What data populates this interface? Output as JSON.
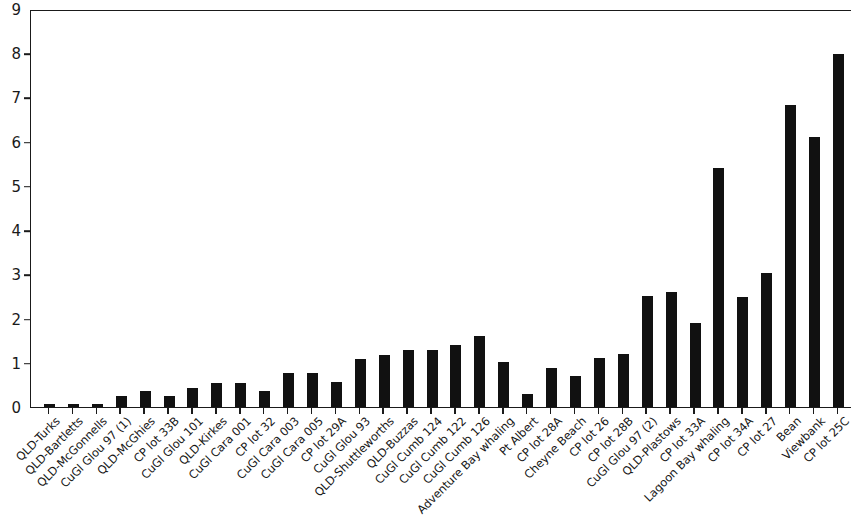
{
  "chart_data": {
    "type": "bar",
    "title": "",
    "subtitle": "",
    "xlabel": "",
    "ylabel": "",
    "ylim": [
      0,
      9
    ],
    "y_ticks": [
      0,
      1,
      2,
      3,
      4,
      5,
      6,
      7,
      8,
      9
    ],
    "grid": false,
    "legend": null,
    "bar_color": "#111111",
    "axis_color": "#1a1a1a",
    "categories": [
      "QLD-Turks",
      "QLD-Bartletts",
      "QLD-McGonnells",
      "CuGl Glou 97 (1)",
      "QLD-McGhies",
      "CP lot 33B",
      "CuGl Glou 101",
      "QLD-Kirkes",
      "CuGl Cara 001",
      "CP lot 32",
      "CuGl Cara 003",
      "CuGl Cara 005",
      "CP lot 29A",
      "CuGl Glou 93",
      "QLD-Shuttleworths",
      "QLD-Buzzas",
      "CuGl Cumb 124",
      "CuGl Cumb 122",
      "CuGl Cumb 126",
      "Adventure Bay whaling",
      "Pt Albert",
      "CP lot 28A",
      "Cheyne Beach",
      "CP lot 26",
      "CP lot 28B",
      "CuGl Glou 97 (2)",
      "QLD-Plastows",
      "CP lot 33A",
      "Lagoon Bay whaling",
      "CP lot 34A",
      "CP lot 27",
      "Bean",
      "Viewbank",
      "CP lot 25C"
    ],
    "values": [
      0.08,
      0.08,
      0.08,
      0.28,
      0.38,
      0.28,
      0.45,
      0.57,
      0.57,
      0.38,
      0.8,
      0.8,
      0.58,
      1.1,
      1.2,
      1.32,
      1.32,
      1.42,
      1.63,
      1.03,
      0.32,
      0.9,
      0.72,
      1.12,
      1.22,
      2.53,
      2.62,
      1.92,
      5.43,
      2.51,
      3.05,
      6.85,
      6.13,
      8.0
    ]
  }
}
